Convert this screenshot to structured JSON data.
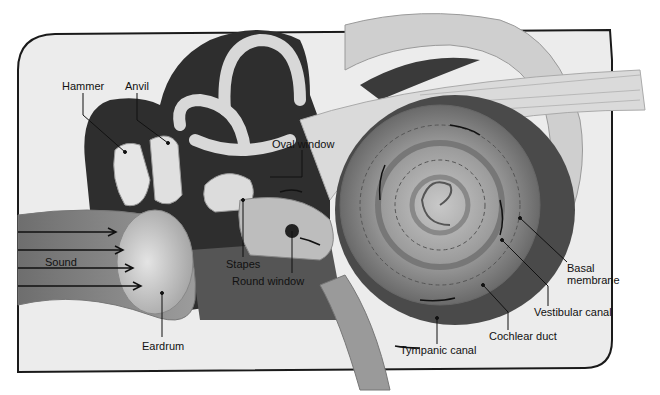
{
  "diagram": {
    "labels": {
      "hammer": "Hammer",
      "anvil": "Anvil",
      "oval_window": "Oval window",
      "stapes": "Stapes",
      "round_window": "Round window",
      "sound": "Sound",
      "eardrum": "Eardrum",
      "basal_membrane_line1": "Basal",
      "basal_membrane_line2": "membrane",
      "vestibular_canal": "Vestibular canal",
      "cochlear_duct": "Cochlear duct",
      "tympanic_canal": "Tympanic canal"
    },
    "colors": {
      "frame": "#1a1a1a",
      "background_panel": "#ececec",
      "dark_cavity": "#3a3a3a",
      "bone_light": "#d6d6d6",
      "tissue_mid": "#8a8a8a"
    }
  }
}
